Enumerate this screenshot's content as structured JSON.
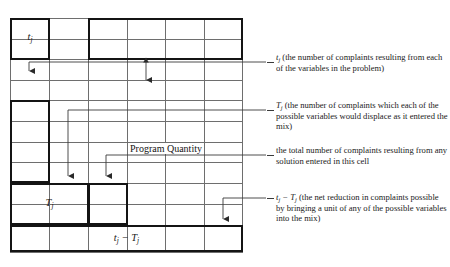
{
  "figure": {
    "type": "simplex-tableau-schematic",
    "grid": {
      "columns": 6,
      "rows": 11,
      "left": 10,
      "top": 18,
      "width": 233,
      "height": 234,
      "column_x": [
        10,
        49,
        88,
        127,
        165,
        204,
        243
      ],
      "row_y": [
        18,
        39,
        59,
        80,
        100,
        121,
        142,
        162,
        183,
        204,
        225,
        252
      ],
      "line_color": "#6e6e6e",
      "emphasis_color": "#141414"
    },
    "cell_labels": [
      {
        "name": "t-sub-j",
        "base": "t",
        "sub": "j",
        "left": 10,
        "top": 18,
        "width": 39,
        "height": 41
      },
      {
        "name": "T-sub-j",
        "base": "T",
        "sub": "j",
        "left": 10,
        "top": 183,
        "width": 78,
        "height": 42
      },
      {
        "name": "t-minus-T",
        "base": "t",
        "sub": "j",
        "base2": " − T",
        "sub2": "j",
        "left": 10,
        "top": 225,
        "width": 233,
        "height": 27
      }
    ],
    "inline_label": {
      "text": "Program Quantity",
      "left": 127,
      "top": 142
    }
  },
  "annotations": [
    {
      "id": "t-j",
      "lead_var": "t",
      "lead_sub": "j",
      "text": " (the number of complaints resulting from each of the variables in the prob-lem)",
      "text_display": " (the number of complaints resulting from each of the variables in the problem)",
      "top": 50
    },
    {
      "id": "T-j",
      "lead_var": "T",
      "lead_sub": "j",
      "text": " (the number of complaints which each of the possible variables would displace as it entered the mix)",
      "top": 98
    },
    {
      "id": "total",
      "lead_var": "",
      "lead_sub": "",
      "text": "the total number of complaints result-ing from any solution entered in this cell",
      "text_display": "the total number of complaints resulting from any solution entered in this cell",
      "top": 143
    },
    {
      "id": "t-minus-T",
      "lead_var": "t",
      "lead_sub": "j",
      "lead_var2": "T",
      "lead_sub2": "j",
      "text": " (the net reduction in complaints possible by bringing a unit of any of the possible variables into the mix)",
      "top": 190
    }
  ],
  "colors": {
    "background": "#ffffff",
    "grid_line": "#6e6e6e",
    "emphasis": "#141414",
    "leader": "#3a3a3a",
    "text": "#1a1a1a"
  }
}
